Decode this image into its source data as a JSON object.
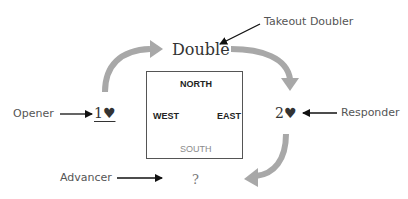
{
  "diagram": {
    "callouts": {
      "takeout_doubler": "Takeout Doubler",
      "opener": "Opener",
      "responder": "Responder",
      "advancer": "Advancer"
    },
    "bids": {
      "double": "Double",
      "opening": "1♥",
      "response": "2♥",
      "advance": "?"
    },
    "table": {
      "north": "NORTH",
      "west": "WEST",
      "east": "EAST",
      "south": "SOUTH"
    },
    "colors": {
      "flow_arrow": "#a8a8a8",
      "pointer_arrow": "#111111",
      "box_border": "#555555",
      "south_label": "#8a8a8a",
      "heart": "#555555"
    }
  }
}
